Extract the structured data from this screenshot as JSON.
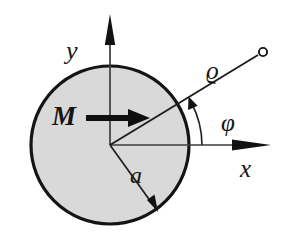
{
  "figure": {
    "kind": "physics-diagram",
    "background_color": "#ffffff",
    "disk": {
      "fill_color": "#d9d9d9",
      "stroke_color": "#141414",
      "center": {
        "x": 110,
        "y": 145
      },
      "radius": 80,
      "stroke_width": 3
    },
    "axes": {
      "stroke_color": "#3a3a3a",
      "origin": {
        "x": 110,
        "y": 145
      },
      "x_axis": {
        "label": "x",
        "tip": {
          "x": 271,
          "y": 145
        }
      },
      "y_axis": {
        "label": "y",
        "tip": {
          "x": 110,
          "y": 14
        }
      }
    },
    "magnetization_vector": {
      "label": "M",
      "color": "#111111",
      "from": {
        "x": 86,
        "y": 118
      },
      "to": {
        "x": 148,
        "y": 118
      }
    },
    "radius_marker": {
      "label": "a",
      "from": {
        "x": 110,
        "y": 145
      },
      "to": {
        "x": 157,
        "y": 210
      }
    },
    "field_point_ray": {
      "label": "ϱ",
      "angle_label": "φ",
      "angle_degrees": 28,
      "from": {
        "x": 110,
        "y": 145
      },
      "to": {
        "x": 262,
        "y": 53
      },
      "endpoint_marker": "open-circle"
    },
    "angle_arc": {
      "label": "φ",
      "radius": 92,
      "start_degrees": 0,
      "end_degrees": 28,
      "arrow_at": "end"
    }
  },
  "labels": {
    "y_axis": "y",
    "x_axis": "x",
    "magnetization": "M",
    "radius": "a",
    "rho": "ϱ",
    "phi": "φ"
  }
}
